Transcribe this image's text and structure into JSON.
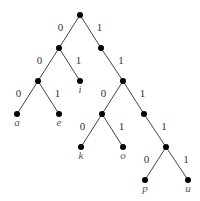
{
  "diagram": {
    "type": "binary-tree",
    "colors": {
      "edge": "#444444",
      "node": "#000000",
      "label": "#333333"
    },
    "nodes": [
      {
        "id": "root",
        "x": 80,
        "y": 15
      },
      {
        "id": "n0",
        "x": 59,
        "y": 48
      },
      {
        "id": "n1",
        "x": 101,
        "y": 48
      },
      {
        "id": "n00",
        "x": 38,
        "y": 81
      },
      {
        "id": "i",
        "x": 80,
        "y": 81,
        "label": "i"
      },
      {
        "id": "n11",
        "x": 123,
        "y": 81
      },
      {
        "id": "a",
        "x": 17,
        "y": 114,
        "label": "a"
      },
      {
        "id": "e",
        "x": 59,
        "y": 114,
        "label": "e"
      },
      {
        "id": "n110",
        "x": 102,
        "y": 114
      },
      {
        "id": "n111",
        "x": 144,
        "y": 114
      },
      {
        "id": "k",
        "x": 81,
        "y": 147,
        "label": "k"
      },
      {
        "id": "o",
        "x": 123,
        "y": 147,
        "label": "o"
      },
      {
        "id": "n1111",
        "x": 166,
        "y": 147
      },
      {
        "id": "p",
        "x": 145,
        "y": 180,
        "label": "p"
      },
      {
        "id": "u",
        "x": 188,
        "y": 180,
        "label": "u"
      }
    ],
    "edges": [
      {
        "from": "root",
        "to": "n0",
        "bit": "0"
      },
      {
        "from": "root",
        "to": "n1",
        "bit": "1"
      },
      {
        "from": "n0",
        "to": "n00",
        "bit": "0"
      },
      {
        "from": "n0",
        "to": "i",
        "bit": "1"
      },
      {
        "from": "n1",
        "to": "n11",
        "bit": "1"
      },
      {
        "from": "n00",
        "to": "a",
        "bit": "0"
      },
      {
        "from": "n00",
        "to": "e",
        "bit": "1"
      },
      {
        "from": "n11",
        "to": "n110",
        "bit": "0"
      },
      {
        "from": "n11",
        "to": "n111",
        "bit": "1"
      },
      {
        "from": "n110",
        "to": "k",
        "bit": "0"
      },
      {
        "from": "n110",
        "to": "o",
        "bit": "1"
      },
      {
        "from": "n111",
        "to": "n1111",
        "bit": "1"
      },
      {
        "from": "n1111",
        "to": "p",
        "bit": "0"
      },
      {
        "from": "n1111",
        "to": "u",
        "bit": "1"
      }
    ]
  }
}
